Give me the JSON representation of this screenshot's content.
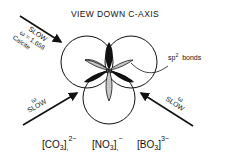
{
  "title": "VIEW DOWN C-AXIS",
  "annotations": {
    "top_left": {
      "line1": "SLOW",
      "line2": "ω = 1.658",
      "line3": "Calcite"
    },
    "bottom_left": {
      "symbol": "ω",
      "label": "SLOW"
    },
    "bottom_right": {
      "symbol": "ω",
      "label": "SLOW"
    },
    "bond_label": {
      "prefix": "sp",
      "sup": "2",
      "suffix": "bonds"
    }
  },
  "ions": [
    {
      "formula": "CO",
      "sub": "3",
      "charge": "2−",
      "sep": ","
    },
    {
      "formula": "NO",
      "sub": "3",
      "charge": "−",
      "sep": ","
    },
    {
      "formula": "BO",
      "sub": "3",
      "charge": "3−",
      "sep": ""
    }
  ],
  "colors": {
    "ink": "#111111",
    "stipple": "#bdbdbd",
    "background": "#ffffff"
  }
}
